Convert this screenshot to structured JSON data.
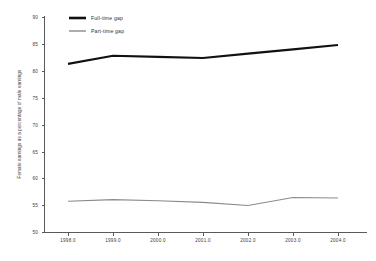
{
  "chart_data": {
    "type": "line",
    "title": "",
    "subtitle": "",
    "xlabel": "",
    "ylabel": "Female earnings as a percentage of male earnings",
    "x": [
      1998,
      1999,
      2000,
      2001,
      2002,
      2003,
      2004
    ],
    "xtick_labels": [
      "1998.0",
      "1999.0",
      "2000.0",
      "2001.0",
      "2002.0",
      "2003.0",
      "2004.0"
    ],
    "ytick_labels": [
      "90",
      "85",
      "80",
      "75",
      "70",
      "65",
      "60",
      "55",
      "50"
    ],
    "yticks": [
      90,
      85,
      80,
      75,
      70,
      65,
      60,
      55,
      50
    ],
    "xlim": [
      1997.6,
      2004.5
    ],
    "ylim": [
      50,
      90
    ],
    "grid": false,
    "legend_position": "top-left-inside",
    "series": [
      {
        "name": "Full-time gap",
        "color": "#111111",
        "width": 2.1,
        "values": [
          81.3,
          82.8,
          82.6,
          82.4,
          83.2,
          84.0,
          84.8
        ]
      },
      {
        "name": "Part-time gap",
        "color": "#8a8a8a",
        "width": 1.1,
        "values": [
          55.8,
          56.1,
          55.9,
          55.6,
          55.0,
          56.5,
          56.4
        ]
      }
    ]
  },
  "legend": {
    "entries": [
      {
        "label": "Full-time gap"
      },
      {
        "label": "Part-time gap"
      }
    ]
  },
  "axes": {
    "y_title": "Female earnings as a percentage of male earnings",
    "y_labels": [
      "90",
      "85",
      "80",
      "75",
      "70",
      "65",
      "60",
      "55",
      "50"
    ],
    "x_labels": [
      "1998.0",
      "1999.0",
      "2000.0",
      "2001.0",
      "2002.0",
      "2003.0",
      "2004.0"
    ]
  }
}
